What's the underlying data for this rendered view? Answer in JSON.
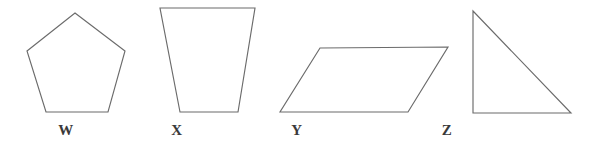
{
  "figure": {
    "width": 602,
    "height": 153,
    "background_color": "#ffffff",
    "stroke_color": "#6b6b6b",
    "label_color": "#3a3a3a"
  },
  "shapes": [
    {
      "label": "W",
      "kind": "regular-pentagon",
      "points": "75,13 125,51 108,112 46,112 27,51",
      "label_x": 66,
      "label_y": 123
    },
    {
      "label": "X",
      "kind": "trapezoid",
      "points": "160,8 255,8 238,112 180,112",
      "label_x": 177,
      "label_y": 123
    },
    {
      "label": "Y",
      "kind": "parallelogram",
      "points": "320,48 448,47 408,112 280,112",
      "label_x": 297,
      "label_y": 123
    },
    {
      "label": "Z",
      "kind": "right-triangle",
      "points": "473,11 571,113 473,113",
      "label_x": 447,
      "label_y": 123
    }
  ]
}
